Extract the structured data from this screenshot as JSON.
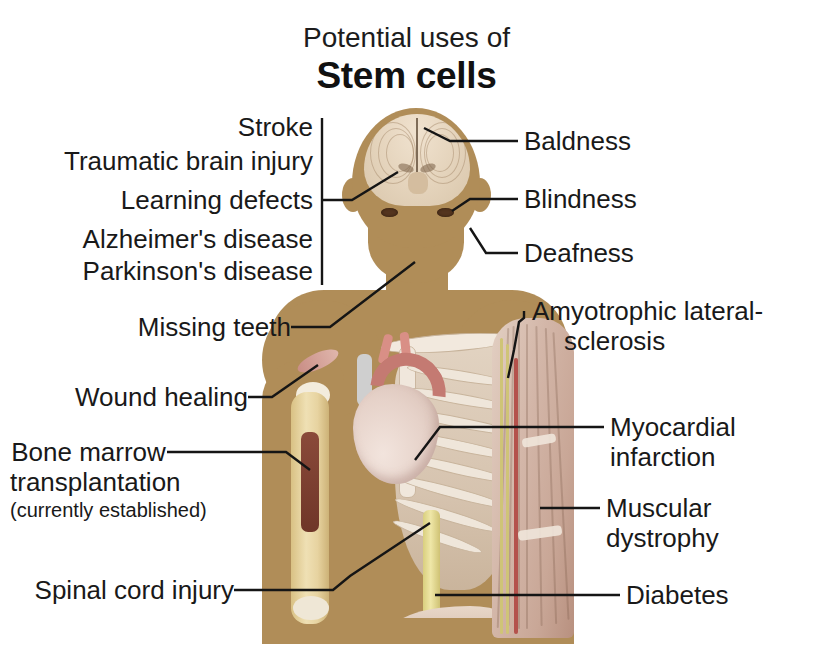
{
  "title": {
    "sub": "Potential uses of",
    "main": "Stem cells"
  },
  "colors": {
    "silhouette": "#b08d58",
    "text": "#191919",
    "leader_line": "#151515",
    "background": "#ffffff",
    "marrow": "#7a3e2f",
    "spinal_cord": "#e0d58b",
    "heart": "#e6d2c9",
    "aorta": "#c47a72"
  },
  "labels_left": [
    {
      "id": "stroke",
      "text": "Stroke"
    },
    {
      "id": "traumatic-brain-injury",
      "text": "Traumatic brain injury"
    },
    {
      "id": "learning-defects",
      "text": "Learning defects"
    },
    {
      "id": "alzheimers-disease",
      "text": "Alzheimer's disease"
    },
    {
      "id": "parkinsons-disease",
      "text": "Parkinson's disease"
    },
    {
      "id": "missing-teeth",
      "text": "Missing teeth"
    },
    {
      "id": "wound-healing",
      "text": "Wound healing"
    },
    {
      "id": "bone-marrow-transplantation",
      "line1": "Bone marrow",
      "line2": "transplantation",
      "note": "(currently established)"
    },
    {
      "id": "spinal-cord-injury",
      "text": "Spinal cord injury"
    }
  ],
  "labels_right": [
    {
      "id": "baldness",
      "text": "Baldness"
    },
    {
      "id": "blindness",
      "text": "Blindness"
    },
    {
      "id": "deafness",
      "text": "Deafness"
    },
    {
      "id": "amyotrophic-lateral-sclerosis",
      "line1": "Amyotrophic lateral-",
      "line2": "sclerosis"
    },
    {
      "id": "myocardial-infarction",
      "line1": "Myocardial",
      "line2": "infarction"
    },
    {
      "id": "muscular-dystrophy",
      "line1": "Muscular",
      "line2": "dystrophy"
    },
    {
      "id": "diabetes",
      "text": "Diabetes"
    }
  ],
  "figure": {
    "name": "human-body-anatomy-illustration",
    "parts": [
      "brain-cross-section",
      "eyes",
      "head-silhouette",
      "neck",
      "heart",
      "aorta",
      "ribcage",
      "clavicle",
      "sternum",
      "spinal-cord",
      "pancreas",
      "humerus-bone",
      "bone-marrow-cavity",
      "shoulder-wound",
      "right-arm-musculature",
      "nerves",
      "arteries"
    ]
  }
}
